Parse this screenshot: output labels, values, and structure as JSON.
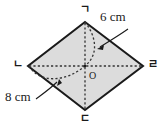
{
  "figure": {
    "name": "rhombus-pyramid-diagram",
    "shape": "rhombus",
    "fill_color": "#dcdcdc",
    "stroke_color": "#1a1a1a",
    "dotted_color": "#333333",
    "background_color": "#ffffff",
    "vertices": [
      {
        "id": "top",
        "label": "ㄱ",
        "x": 85,
        "y": 22
      },
      {
        "id": "left",
        "label": "ㄴ",
        "x": 28,
        "y": 66
      },
      {
        "id": "bottom",
        "label": "ㄷ",
        "x": 85,
        "y": 110
      },
      {
        "id": "right",
        "label": "ㄹ",
        "x": 143,
        "y": 66
      }
    ],
    "center": {
      "id": "center",
      "label": "O",
      "x": 85,
      "y": 66
    },
    "dimensions": [
      {
        "id": "edge-measure",
        "label": "6 cm",
        "value": 6,
        "unit": "cm"
      },
      {
        "id": "diagonal-measure",
        "label": "8 cm",
        "value": 8,
        "unit": "cm"
      }
    ]
  }
}
